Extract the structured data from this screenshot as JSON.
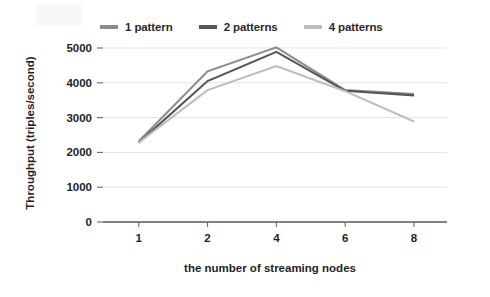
{
  "chart_data": {
    "type": "line",
    "title": "",
    "xlabel": "the number of streaming nodes",
    "ylabel": "Throughput (triples/second)",
    "categories": [
      "1",
      "2",
      "4",
      "6",
      "8"
    ],
    "xtick_labels": [
      "1",
      "2",
      "4",
      "6",
      "8"
    ],
    "ytick_labels": [
      "0",
      "1000",
      "2000",
      "3000",
      "4000",
      "5000"
    ],
    "yticks": [
      0,
      1000,
      2000,
      3000,
      4000,
      5000
    ],
    "ylim": [
      0,
      5000
    ],
    "grid": "horizontal",
    "legend_position": "top",
    "series": [
      {
        "name": "1 pattern",
        "color": "#8c8c8c",
        "values": [
          2320,
          4330,
          5020,
          3790,
          3680
        ]
      },
      {
        "name": "2 patterns",
        "color": "#565656",
        "values": [
          2280,
          4050,
          4890,
          3770,
          3640
        ]
      },
      {
        "name": "4 patterns",
        "color": "#bdbdbd",
        "values": [
          2280,
          3790,
          4480,
          3760,
          2890
        ]
      }
    ]
  },
  "legend": {
    "items": [
      {
        "label": "1 pattern",
        "color": "#8c8c8c"
      },
      {
        "label": "2 patterns",
        "color": "#565656"
      },
      {
        "label": "4 patterns",
        "color": "#bdbdbd"
      }
    ]
  },
  "colors": {
    "background": "#ffffff",
    "gridline": "#e3e3e3",
    "axis": "#5a5a5a",
    "text": "#1f1f1f"
  }
}
